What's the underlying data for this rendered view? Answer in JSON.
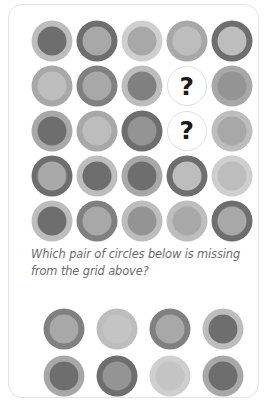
{
  "card": {
    "background": "#ffffff",
    "border_color": "#e3e3e3"
  },
  "prompt": {
    "text": "Which pair of circles below is missing from the grid above?",
    "color": "#6b6b6b"
  },
  "placeholder": {
    "glyph": "?",
    "outline_color": "#dfdfdf",
    "glyph_color": "#1a1a1a"
  },
  "palette": {
    "dark": "#6e6e6e",
    "mid_dark": "#808080",
    "mid": "#949494",
    "mid_light": "#a8a8a8",
    "light": "#bdbdbd",
    "pale": "#cfcfcf"
  },
  "grid": {
    "rows": 5,
    "cols": 5,
    "cells": [
      [
        {
          "type": "circle",
          "outer": "#bdbdbd",
          "inner": "#6e6e6e"
        },
        {
          "type": "circle",
          "outer": "#6e6e6e",
          "inner": "#a8a8a8"
        },
        {
          "type": "circle",
          "outer": "#cfcfcf",
          "inner": "#a8a8a8"
        },
        {
          "type": "circle",
          "outer": "#a8a8a8",
          "inner": "#bdbdbd"
        },
        {
          "type": "circle",
          "outer": "#6e6e6e",
          "inner": "#bdbdbd"
        }
      ],
      [
        {
          "type": "circle",
          "outer": "#a8a8a8",
          "inner": "#bdbdbd"
        },
        {
          "type": "circle",
          "outer": "#808080",
          "inner": "#a8a8a8"
        },
        {
          "type": "circle",
          "outer": "#bdbdbd",
          "inner": "#808080"
        },
        {
          "type": "placeholder"
        },
        {
          "type": "circle",
          "outer": "#a8a8a8",
          "inner": "#949494"
        }
      ],
      [
        {
          "type": "circle",
          "outer": "#a8a8a8",
          "inner": "#6e6e6e"
        },
        {
          "type": "circle",
          "outer": "#a8a8a8",
          "inner": "#bdbdbd"
        },
        {
          "type": "circle",
          "outer": "#6e6e6e",
          "inner": "#949494"
        },
        {
          "type": "placeholder"
        },
        {
          "type": "circle",
          "outer": "#bdbdbd",
          "inner": "#a8a8a8"
        }
      ],
      [
        {
          "type": "circle",
          "outer": "#6e6e6e",
          "inner": "#a8a8a8"
        },
        {
          "type": "circle",
          "outer": "#bdbdbd",
          "inner": "#6e6e6e"
        },
        {
          "type": "circle",
          "outer": "#a8a8a8",
          "inner": "#6e6e6e"
        },
        {
          "type": "circle",
          "outer": "#6e6e6e",
          "inner": "#bdbdbd"
        },
        {
          "type": "circle",
          "outer": "#cfcfcf",
          "inner": "#bdbdbd"
        }
      ],
      [
        {
          "type": "circle",
          "outer": "#bdbdbd",
          "inner": "#6e6e6e"
        },
        {
          "type": "circle",
          "outer": "#808080",
          "inner": "#a8a8a8"
        },
        {
          "type": "circle",
          "outer": "#bdbdbd",
          "inner": "#949494"
        },
        {
          "type": "circle",
          "outer": "#bdbdbd",
          "inner": "#a8a8a8"
        },
        {
          "type": "circle",
          "outer": "#6e6e6e",
          "inner": "#a8a8a8"
        }
      ]
    ]
  },
  "answers": {
    "rows": 2,
    "cols": 4,
    "options": [
      {
        "top": {
          "outer": "#808080",
          "inner": "#a8a8a8"
        },
        "bottom": {
          "outer": "#a8a8a8",
          "inner": "#6e6e6e"
        }
      },
      {
        "top": {
          "outer": "#bdbdbd",
          "inner": "#c4c4c4"
        },
        "bottom": {
          "outer": "#6e6e6e",
          "inner": "#949494"
        }
      },
      {
        "top": {
          "outer": "#808080",
          "inner": "#a8a8a8"
        },
        "bottom": {
          "outer": "#cfcfcf",
          "inner": "#c4c4c4"
        }
      },
      {
        "top": {
          "outer": "#bdbdbd",
          "inner": "#6e6e6e"
        },
        "bottom": {
          "outer": "#a8a8a8",
          "inner": "#6e6e6e"
        }
      }
    ]
  }
}
